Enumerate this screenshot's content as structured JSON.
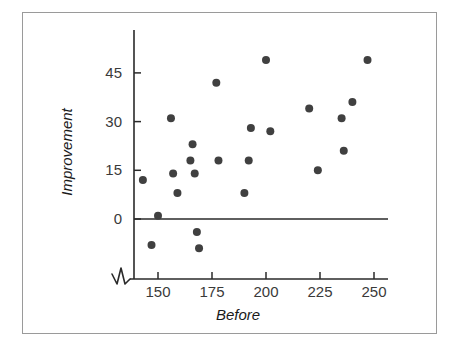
{
  "chart_data": {
    "type": "scatter",
    "title": "",
    "xlabel": "Before",
    "ylabel": "Improvement",
    "xlim": [
      136,
      262
    ],
    "ylim": [
      -14,
      55
    ],
    "grid": false,
    "legend": null,
    "axis_break": true,
    "zero_reference_line": 0,
    "xticks": [
      150,
      175,
      200,
      225,
      250
    ],
    "yticks": [
      0,
      15,
      30,
      45
    ],
    "xtick_labels": [
      "150",
      "175",
      "200",
      "225",
      "250"
    ],
    "ytick_labels": [
      "0",
      "15",
      "30",
      "45"
    ],
    "points": [
      {
        "x": 143,
        "y": 12
      },
      {
        "x": 147,
        "y": -8
      },
      {
        "x": 150,
        "y": 1
      },
      {
        "x": 156,
        "y": 31
      },
      {
        "x": 157,
        "y": 14
      },
      {
        "x": 159,
        "y": 8
      },
      {
        "x": 165,
        "y": 18
      },
      {
        "x": 166,
        "y": 23
      },
      {
        "x": 167,
        "y": 14
      },
      {
        "x": 168,
        "y": -4
      },
      {
        "x": 169,
        "y": -9
      },
      {
        "x": 177,
        "y": 42
      },
      {
        "x": 178,
        "y": 18
      },
      {
        "x": 190,
        "y": 8
      },
      {
        "x": 192,
        "y": 18
      },
      {
        "x": 193,
        "y": 28
      },
      {
        "x": 200,
        "y": 49
      },
      {
        "x": 202,
        "y": 27
      },
      {
        "x": 220,
        "y": 34
      },
      {
        "x": 224,
        "y": 15
      },
      {
        "x": 235,
        "y": 31
      },
      {
        "x": 236,
        "y": 21
      },
      {
        "x": 240,
        "y": 36
      },
      {
        "x": 247,
        "y": 49
      }
    ],
    "marker_color": "#404040",
    "marker_size": 4,
    "axis_color": "#2a2a2a"
  },
  "labels": {
    "y_axis_title": "Improvement",
    "x_axis_title": "Before"
  }
}
